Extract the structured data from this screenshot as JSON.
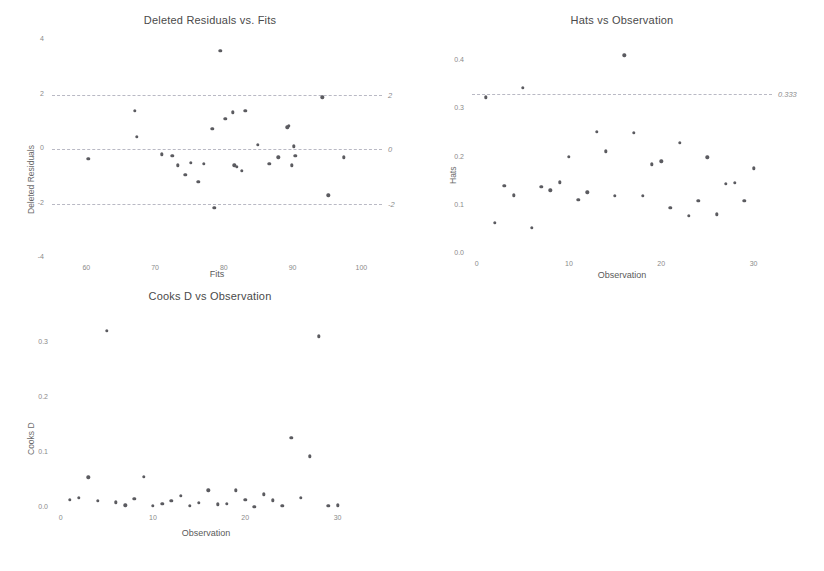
{
  "figure": {
    "background": "#ffffff",
    "point_color": "#5b5b60",
    "refline_color": "#b9b9c4"
  },
  "chart_data": [
    {
      "id": "deleted-residuals-vs-fits",
      "type": "scatter",
      "title": "Deleted Residuals vs. Fits",
      "xlabel": "Fits",
      "ylabel": "Deleted Residuals",
      "xlim": [
        55,
        103
      ],
      "ylim": [
        -4,
        4
      ],
      "xticks": [
        60,
        70,
        80,
        90,
        100
      ],
      "xticklabels": [
        "60",
        "70",
        "80",
        "90",
        "100"
      ],
      "yticks": [
        4,
        2,
        0,
        -2,
        -4
      ],
      "yticklabels": [
        "4",
        "2",
        "0",
        "-2",
        "-4"
      ],
      "grid": false,
      "reference_lines": [
        {
          "y": 2,
          "label": "2",
          "style": "dashed"
        },
        {
          "y": 0,
          "label": "0",
          "style": "dashed"
        },
        {
          "y": -2,
          "label": "-2",
          "style": "dashed"
        }
      ],
      "x": [
        60.3,
        67.0,
        67.3,
        71.0,
        72.5,
        73.3,
        74.4,
        75.2,
        76.3,
        77.1,
        78.3,
        78.6,
        79.5,
        80.2,
        81.3,
        81.5,
        81.9,
        82.6,
        83.1,
        84.9,
        86.6,
        87.9,
        89.2,
        89.4,
        89.9,
        90.2,
        90.4,
        94.3,
        95.2,
        97.4
      ],
      "y": [
        -0.35,
        1.4,
        0.45,
        -0.2,
        -0.25,
        -0.6,
        -0.95,
        -0.5,
        -1.2,
        -0.55,
        0.75,
        -2.15,
        3.6,
        1.1,
        1.35,
        -0.6,
        -0.65,
        -0.8,
        1.4,
        0.15,
        -0.55,
        -0.3,
        0.8,
        0.85,
        -0.6,
        0.1,
        -0.25,
        1.9,
        -1.7,
        -0.3
      ]
    },
    {
      "id": "hats-vs-observation",
      "type": "scatter",
      "title": "Hats vs Observation",
      "xlabel": "Observation",
      "ylabel": "Hats",
      "xlim": [
        -0.5,
        32
      ],
      "ylim": [
        0.0,
        0.44
      ],
      "xticks": [
        0,
        10,
        20,
        30
      ],
      "xticklabels": [
        "0",
        "10",
        "20",
        "30"
      ],
      "yticks": [
        0.4,
        0.3,
        0.2,
        0.1,
        0.0
      ],
      "yticklabels": [
        "0.4",
        "0.3",
        "0.2",
        "0.1",
        "0.0"
      ],
      "grid": false,
      "reference_lines": [
        {
          "y": 0.333,
          "label": "0.333",
          "style": "dashed"
        }
      ],
      "x": [
        1,
        2,
        3,
        4,
        5,
        6,
        7,
        8,
        9,
        10,
        11,
        12,
        13,
        14,
        15,
        16,
        17,
        18,
        19,
        20,
        21,
        22,
        23,
        24,
        25,
        26,
        27,
        28,
        29,
        30
      ],
      "y": [
        0.325,
        0.065,
        0.142,
        0.122,
        0.345,
        0.055,
        0.139,
        0.132,
        0.149,
        0.202,
        0.112,
        0.128,
        0.253,
        0.213,
        0.121,
        0.412,
        0.252,
        0.121,
        0.186,
        0.192,
        0.096,
        0.231,
        0.079,
        0.111,
        0.201,
        0.082,
        0.146,
        0.148,
        0.11,
        0.178
      ]
    },
    {
      "id": "cooks-d-vs-observation",
      "type": "scatter",
      "title": "Cooks D vs Observation",
      "xlabel": "Observation",
      "ylabel": "Cooks D",
      "xlim": [
        -0.5,
        32
      ],
      "ylim": [
        0.0,
        0.345
      ],
      "xticks": [
        0,
        10,
        20,
        30
      ],
      "xticklabels": [
        "0",
        "10",
        "20",
        "30"
      ],
      "yticks": [
        0.3,
        0.2,
        0.1,
        0.0
      ],
      "yticklabels": [
        "0.3",
        "0.2",
        "0.1",
        "0.0"
      ],
      "grid": false,
      "reference_lines": [],
      "x": [
        1,
        2,
        3,
        4,
        5,
        6,
        7,
        8,
        9,
        10,
        11,
        12,
        13,
        14,
        15,
        16,
        17,
        18,
        19,
        20,
        21,
        22,
        23,
        24,
        25,
        26,
        27,
        28,
        29,
        30
      ],
      "y": [
        0.015,
        0.019,
        0.056,
        0.013,
        0.322,
        0.01,
        0.005,
        0.017,
        0.057,
        0.004,
        0.008,
        0.013,
        0.022,
        0.004,
        0.009,
        0.032,
        0.007,
        0.008,
        0.032,
        0.015,
        0.002,
        0.025,
        0.014,
        0.004,
        0.127,
        0.018,
        0.094,
        0.312,
        0.004,
        0.005
      ]
    }
  ]
}
